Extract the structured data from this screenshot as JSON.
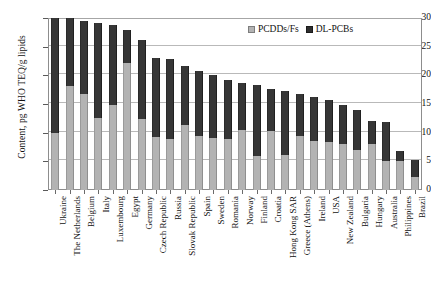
{
  "chart_data": {
    "type": "bar",
    "subtype": "stacked-vertical",
    "title": "",
    "xlabel": "",
    "ylabel": "Content, pg WHO TEQ/g lipids",
    "ylim": [
      0,
      30
    ],
    "yticks": [
      0,
      5,
      10,
      15,
      20,
      25,
      30
    ],
    "grid": true,
    "legend_position": "top-right",
    "categories": [
      "Ukraine",
      "The Netherlands",
      "Belgium",
      "Italy",
      "Luxembourg",
      "Egypt",
      "Germany",
      "Czech Republic",
      "Russia",
      "Slovak Republic",
      "Spain",
      "Sweden",
      "Romania",
      "Norway",
      "Finland",
      "Croatia",
      "Hong Kong SAR",
      "Greece (Athens)",
      "Ireland",
      "USA",
      "New Zealand",
      "Bulgaria",
      "Hungary",
      "Australia",
      "Philippines",
      "Brazil"
    ],
    "series": [
      {
        "name": "PCDDs/Fs",
        "color": "#b3b3b3",
        "values": [
          10.0,
          18.1,
          16.8,
          12.5,
          14.9,
          22.2,
          12.4,
          9.2,
          8.9,
          11.3,
          9.4,
          9.1,
          8.9,
          10.5,
          6.0,
          10.3,
          6.1,
          9.4,
          8.6,
          8.4,
          8.0,
          6.9,
          8.0,
          5.1,
          5.0,
          2.2
        ]
      },
      {
        "name": "DL-PCBs",
        "color": "#2e2e2e",
        "values": [
          20.0,
          11.9,
          12.7,
          16.6,
          13.8,
          5.7,
          13.8,
          13.8,
          13.9,
          10.3,
          11.4,
          11.0,
          10.3,
          8.1,
          12.3,
          7.4,
          11.2,
          7.3,
          7.6,
          7.3,
          6.8,
          7.0,
          4.1,
          6.7,
          1.8,
          3.1
        ]
      }
    ],
    "totals": [
      30.0,
      30.0,
      29.5,
      29.1,
      28.7,
      27.9,
      26.2,
      23.0,
      22.8,
      21.6,
      20.8,
      20.1,
      19.2,
      18.6,
      18.3,
      17.7,
      17.3,
      16.7,
      16.2,
      15.7,
      14.8,
      13.9,
      12.1,
      11.8,
      6.8,
      5.3
    ]
  },
  "legend": {
    "items": [
      {
        "label": "PCDDs/Fs"
      },
      {
        "label": "DL-PCBs"
      }
    ]
  },
  "axes": {
    "y_title": "Content, pg WHO TEQ/g lipids"
  }
}
